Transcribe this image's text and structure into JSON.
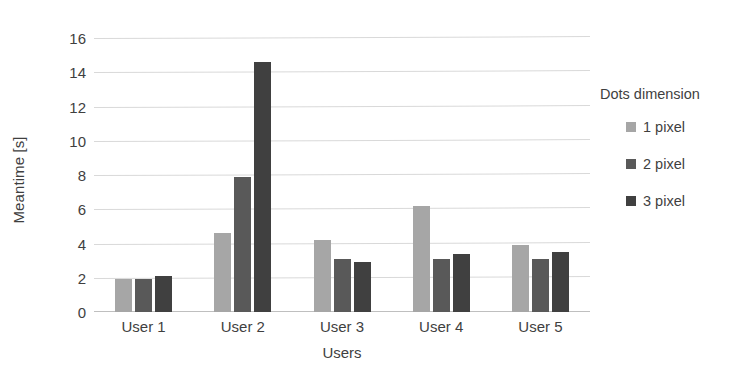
{
  "chart_data": {
    "type": "bar",
    "title": "",
    "subtitle": "",
    "xlabel": "Users",
    "ylabel": "Meantime [s]",
    "categories": [
      "User 1",
      "User 2",
      "User 3",
      "User 4",
      "User 5"
    ],
    "series": [
      {
        "name": "1 pixel",
        "color": "#a6a6a6",
        "values": [
          1.9,
          4.6,
          4.2,
          6.2,
          3.9
        ]
      },
      {
        "name": "2 pixel",
        "color": "#595959",
        "values": [
          1.9,
          7.9,
          3.1,
          3.1,
          3.1
        ]
      },
      {
        "name": "3 pixel",
        "color": "#404040",
        "values": [
          2.1,
          14.6,
          2.9,
          3.4,
          3.5
        ]
      }
    ],
    "ylim": [
      0,
      16
    ],
    "y_ticks": [
      0,
      2,
      4,
      6,
      8,
      10,
      12,
      14,
      16
    ],
    "y_tick_labels": [
      "0",
      "2",
      "4",
      "6",
      "8",
      "10",
      "12",
      "14",
      "16"
    ],
    "grid": true,
    "grid_color": "#d9d9d9",
    "legend": {
      "title": "Dots dimension",
      "position": "right",
      "entries": [
        "1 pixel",
        "2 pixel",
        "3 pixel"
      ]
    },
    "background_color": "#ffffff"
  }
}
